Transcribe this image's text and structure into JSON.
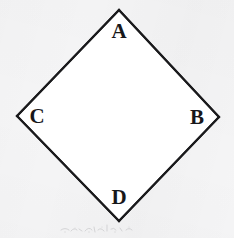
{
  "figure": {
    "name": "quadrilateral-abdc-diagram",
    "canvas": {
      "width": 234,
      "height": 238,
      "background_color": "#f5f5f6",
      "interior_fill": "#ffffff"
    },
    "stroke": {
      "color": "#1a1a1c",
      "width": 2
    },
    "label_style": {
      "color": "#17171a",
      "font_size": 21,
      "weight": "bold"
    },
    "vertices": [
      {
        "id": "A",
        "label": "A",
        "x": 119,
        "y": 10,
        "position": "top",
        "label_x": 119,
        "label_y": 31
      },
      {
        "id": "B",
        "label": "B",
        "x": 219,
        "y": 117,
        "position": "right",
        "label_x": 197,
        "label_y": 117
      },
      {
        "id": "D",
        "label": "D",
        "x": 119,
        "y": 221,
        "position": "bottom",
        "label_x": 119,
        "label_y": 197
      },
      {
        "id": "C",
        "label": "C",
        "x": 17,
        "y": 116,
        "position": "left",
        "label_x": 37,
        "label_y": 116
      }
    ],
    "edges": [
      {
        "from": "A",
        "to": "B"
      },
      {
        "from": "B",
        "to": "D"
      },
      {
        "from": "D",
        "to": "C"
      },
      {
        "from": "C",
        "to": "A"
      }
    ],
    "path": "M 119 10 L 219 117 L 119 221 L 17 116 Z",
    "artifacts": {
      "scan_smudge": {
        "present": true,
        "x": 58,
        "y": 221,
        "width": 78,
        "height": 14,
        "color": "#b9b9bc"
      }
    }
  }
}
